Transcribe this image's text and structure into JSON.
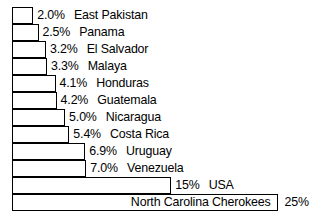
{
  "chart_data": {
    "type": "bar",
    "orientation": "horizontal",
    "title": "",
    "subtitle": "",
    "xlabel": "",
    "ylabel": "",
    "grid": false,
    "legend": null,
    "axis_visible": false,
    "value_unit": "%",
    "xlim": [
      0,
      25
    ],
    "categories": [
      "East Pakistan",
      "Panama",
      "El Salvador",
      "Malaya",
      "Honduras",
      "Guatemala",
      "Nicaragua",
      "Costa Rica",
      "Uruguay",
      "Venezuela",
      "USA",
      "North Carolina Cherokees"
    ],
    "values": [
      2.0,
      2.5,
      3.2,
      3.3,
      4.1,
      4.2,
      5.0,
      5.4,
      6.9,
      7.0,
      15,
      25
    ],
    "value_labels": [
      "2.0%",
      "2.5%",
      "3.2%",
      "3.3%",
      "4.1%",
      "4.2%",
      "5.0%",
      "5.4%",
      "6.9%",
      "7.0%",
      "15%",
      "25%"
    ],
    "bars": [
      {
        "label": "East Pakistan",
        "value": 2.0,
        "value_label": "2.0%",
        "label_position": "outside"
      },
      {
        "label": "Panama",
        "value": 2.5,
        "value_label": "2.5%",
        "label_position": "outside"
      },
      {
        "label": "El Salvador",
        "value": 3.2,
        "value_label": "3.2%",
        "label_position": "outside"
      },
      {
        "label": "Malaya",
        "value": 3.3,
        "value_label": "3.3%",
        "label_position": "outside"
      },
      {
        "label": "Honduras",
        "value": 4.1,
        "value_label": "4.1%",
        "label_position": "outside"
      },
      {
        "label": "Guatemala",
        "value": 4.2,
        "value_label": "4.2%",
        "label_position": "outside"
      },
      {
        "label": "Nicaragua",
        "value": 5.0,
        "value_label": "5.0%",
        "label_position": "outside"
      },
      {
        "label": "Costa Rica",
        "value": 5.4,
        "value_label": "5.4%",
        "label_position": "outside"
      },
      {
        "label": "Uruguay",
        "value": 6.9,
        "value_label": "6.9%",
        "label_position": "outside"
      },
      {
        "label": "Venezuela",
        "value": 7.0,
        "value_label": "7.0%",
        "label_position": "outside"
      },
      {
        "label": "USA",
        "value": 15,
        "value_label": "15%",
        "label_position": "outside"
      },
      {
        "label": "North Carolina Cherokees",
        "value": 25,
        "value_label": "25%",
        "label_position": "inside"
      }
    ],
    "colors": {
      "bar_fill": "#ffffff",
      "bar_stroke": "#000000",
      "text": "#000000",
      "background": "#ffffff"
    }
  },
  "layout": {
    "bar_left_px": 12,
    "bar_top_px": 7,
    "row_height_px": 17,
    "px_per_unit": 10.62
  }
}
